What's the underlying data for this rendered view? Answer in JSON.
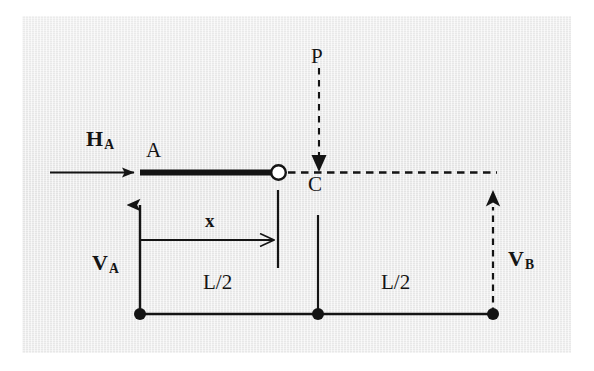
{
  "figure": {
    "background_color": "#ffffff",
    "panel_color": "#eeeeee",
    "ink_color": "#141414"
  },
  "labels": {
    "h_a": {
      "text": "H",
      "sub": "A",
      "x": 86,
      "y": 128
    },
    "point_a": {
      "text": "A",
      "x": 146,
      "y": 140
    },
    "point_c": {
      "text": "C",
      "x": 308,
      "y": 174
    },
    "load_p": {
      "text": "P",
      "x": 311,
      "y": 46
    },
    "v_a": {
      "text": "V",
      "sub": "A",
      "x": 92,
      "y": 252
    },
    "v_b": {
      "text": "V",
      "sub": "B",
      "x": 508,
      "y": 248
    },
    "dim_x": {
      "text": "x",
      "x": 205,
      "y": 211
    },
    "dim_left": {
      "text": "L/2",
      "x": 203,
      "y": 272
    },
    "dim_right": {
      "text": "L/2",
      "x": 381,
      "y": 272
    }
  },
  "geometry": {
    "beam": {
      "x1": 140,
      "y": 172,
      "x2": 272,
      "thickness": 6
    },
    "hinge": {
      "cx": 278,
      "cy": 172,
      "r": 7
    },
    "dashed_beam_right": {
      "x1": 288,
      "y": 172,
      "x2": 497
    },
    "h_a_arrow": {
      "x1": 50,
      "y": 172,
      "x2": 137
    },
    "p_arrow": {
      "x": 319,
      "y1": 68,
      "y2": 172
    },
    "v_a_arrow": {
      "x": 140,
      "y1": 314,
      "y2": 191
    },
    "v_b_arrow": {
      "x": 493,
      "y1": 314,
      "y2": 191
    },
    "dim_baseline": {
      "x1": 140,
      "y": 314,
      "x2": 493
    },
    "dim_dots": [
      {
        "cx": 140,
        "cy": 314
      },
      {
        "cx": 318,
        "cy": 314
      },
      {
        "cx": 493,
        "cy": 314
      }
    ],
    "center_tick": {
      "x": 318,
      "y1": 215,
      "y2": 314
    },
    "x_extension_tick": {
      "x": 278,
      "y1": 190,
      "y2": 268
    },
    "x_dim_line": {
      "x1": 140,
      "y": 240,
      "x2": 278
    }
  }
}
